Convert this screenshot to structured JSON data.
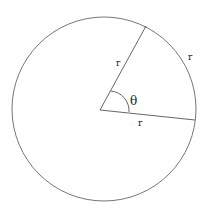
{
  "diagram": {
    "labels": {
      "radius_upper": "r",
      "radius_lower": "r",
      "arc": "r",
      "angle": "θ"
    },
    "colors": {
      "stroke": "#555555",
      "text": "#222222",
      "background": "#ffffff"
    }
  }
}
